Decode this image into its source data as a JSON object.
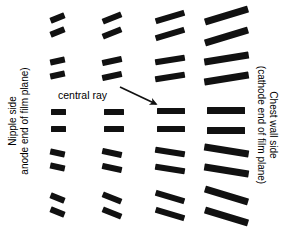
{
  "figure": {
    "background_color": "#ffffff",
    "bar_color": "#111111"
  },
  "left_label": {
    "name": "nipple-side-label",
    "line1": "Nipple side",
    "line2": "anode end of film plane)",
    "rotation_deg": -90
  },
  "right_label": {
    "name": "chest-wall-side-label",
    "line1": "Chest wall side",
    "line2": "(cathode end of film plane)",
    "rotation_deg": 90
  },
  "annotation": {
    "central_ray_label": "central ray",
    "arrow": {
      "from": [
        120,
        87
      ],
      "to": [
        160,
        106
      ]
    }
  },
  "chart_data": {
    "type": "scatter",
    "xlabel": "",
    "ylabel": "",
    "columns": 4,
    "rows": 5,
    "col_x": [
      57,
      112,
      170,
      225
    ],
    "row_y": [
      25,
      68,
      120,
      160,
      205
    ],
    "markers": [
      {
        "row": 1,
        "col": 1,
        "cx": 57,
        "cy": 25,
        "len": 15,
        "thick": 6,
        "gap": 8,
        "angle": -22
      },
      {
        "row": 1,
        "col": 2,
        "cx": 112,
        "cy": 25,
        "len": 20,
        "thick": 6,
        "gap": 9,
        "angle": -22
      },
      {
        "row": 1,
        "col": 3,
        "cx": 170,
        "cy": 25,
        "len": 30,
        "thick": 6,
        "gap": 11,
        "angle": -17
      },
      {
        "row": 1,
        "col": 4,
        "cx": 226,
        "cy": 26,
        "len": 45,
        "thick": 7,
        "gap": 14,
        "angle": -17
      },
      {
        "row": 2,
        "col": 1,
        "cx": 57,
        "cy": 68,
        "len": 15,
        "thick": 6,
        "gap": 8,
        "angle": -12
      },
      {
        "row": 2,
        "col": 2,
        "cx": 112,
        "cy": 68,
        "len": 20,
        "thick": 6,
        "gap": 9,
        "angle": -12
      },
      {
        "row": 2,
        "col": 3,
        "cx": 170,
        "cy": 68,
        "len": 30,
        "thick": 6,
        "gap": 11,
        "angle": -9
      },
      {
        "row": 2,
        "col": 4,
        "cx": 226,
        "cy": 68,
        "len": 45,
        "thick": 7,
        "gap": 13,
        "angle": -9
      },
      {
        "row": 3,
        "col": 1,
        "cx": 58,
        "cy": 120,
        "len": 15,
        "thick": 6,
        "gap": 11,
        "angle": 0
      },
      {
        "row": 3,
        "col": 2,
        "cx": 114,
        "cy": 120,
        "len": 20,
        "thick": 6,
        "gap": 11,
        "angle": 0
      },
      {
        "row": 3,
        "col": 3,
        "cx": 171,
        "cy": 120,
        "len": 28,
        "thick": 6,
        "gap": 12,
        "angle": 0
      },
      {
        "row": 3,
        "col": 4,
        "cx": 226,
        "cy": 120,
        "len": 38,
        "thick": 7,
        "gap": 13,
        "angle": 0
      },
      {
        "row": 4,
        "col": 1,
        "cx": 57,
        "cy": 160,
        "len": 15,
        "thick": 6,
        "gap": 8,
        "angle": 12
      },
      {
        "row": 4,
        "col": 2,
        "cx": 112,
        "cy": 160,
        "len": 20,
        "thick": 6,
        "gap": 9,
        "angle": 12
      },
      {
        "row": 4,
        "col": 3,
        "cx": 170,
        "cy": 160,
        "len": 30,
        "thick": 6,
        "gap": 11,
        "angle": 9
      },
      {
        "row": 4,
        "col": 4,
        "cx": 226,
        "cy": 160,
        "len": 45,
        "thick": 7,
        "gap": 13,
        "angle": 9
      },
      {
        "row": 5,
        "col": 1,
        "cx": 57,
        "cy": 205,
        "len": 15,
        "thick": 6,
        "gap": 8,
        "angle": 22
      },
      {
        "row": 5,
        "col": 2,
        "cx": 112,
        "cy": 205,
        "len": 20,
        "thick": 6,
        "gap": 9,
        "angle": 22
      },
      {
        "row": 5,
        "col": 3,
        "cx": 170,
        "cy": 205,
        "len": 30,
        "thick": 6,
        "gap": 11,
        "angle": 17
      },
      {
        "row": 5,
        "col": 4,
        "cx": 226,
        "cy": 206,
        "len": 45,
        "thick": 7,
        "gap": 14,
        "angle": 17
      }
    ]
  }
}
